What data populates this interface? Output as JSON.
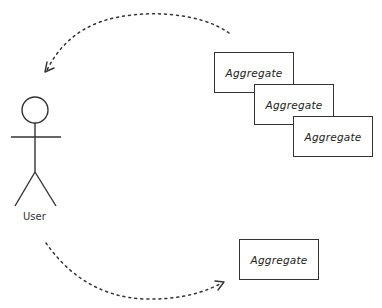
{
  "diagram": {
    "type": "use-case-sketch",
    "actor": {
      "label": "User"
    },
    "aggregates_stack": [
      {
        "label": "Aggregate",
        "x": 214,
        "y": 52
      },
      {
        "label": "Aggregate",
        "x": 254,
        "y": 84
      },
      {
        "label": "Aggregate",
        "x": 293,
        "y": 116
      }
    ],
    "single_aggregate": {
      "label": "Aggregate",
      "x": 239,
      "y": 239
    },
    "arrows": [
      {
        "name": "aggregates-to-user",
        "style": "dotted",
        "from": "aggregates_stack",
        "to": "actor"
      },
      {
        "name": "user-to-aggregate",
        "style": "dotted",
        "from": "actor",
        "to": "single_aggregate"
      }
    ],
    "colors": {
      "stroke": "#333333",
      "background": "#ffffff",
      "text": "#222222"
    }
  }
}
